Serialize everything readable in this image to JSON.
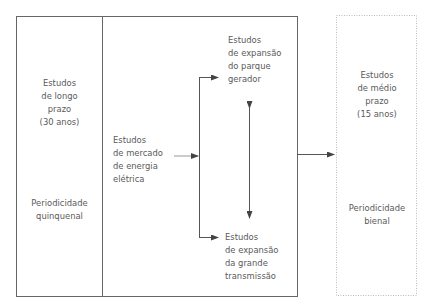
{
  "diagram": {
    "left_panel": {
      "title_lines": [
        "Estudos",
        "de longo",
        "prazo",
        "(30 anos)"
      ],
      "periodicity_lines": [
        "Periodicidade",
        "quinquenal"
      ]
    },
    "center_panel": {
      "market_study_lines": [
        "Estudos",
        "de mercado",
        "de energia",
        "elétrica"
      ],
      "generation_study_lines": [
        "Estudos",
        "de expansão",
        "do parque",
        "gerador"
      ],
      "transmission_study_lines": [
        "Estudos",
        "de expansão",
        "da grande",
        "transmissão"
      ]
    },
    "right_panel": {
      "title_lines": [
        "Estudos",
        "de médio",
        "prazo",
        "(15 anos)"
      ],
      "periodicity_lines": [
        "Periodicidade",
        "bienal"
      ]
    },
    "colors": {
      "line": "#555555",
      "text": "#5a5a5a",
      "dotted_border": "#bbbbbb"
    }
  }
}
